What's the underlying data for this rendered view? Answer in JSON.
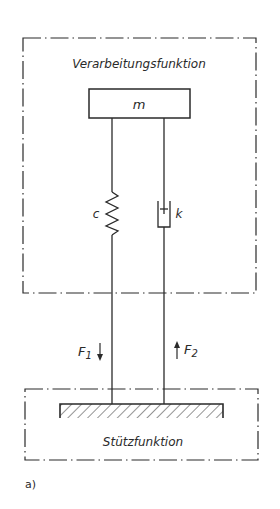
{
  "diagram": {
    "figure_label": "a)",
    "top_region": {
      "label": "Verarbeitungsfunktion"
    },
    "mass": {
      "label": "m"
    },
    "spring": {
      "label": "c"
    },
    "damper": {
      "label": "k"
    },
    "forces": {
      "f1": {
        "label": "F",
        "subscript": "1",
        "direction": "down"
      },
      "f2": {
        "label": "F",
        "subscript": "2",
        "direction": "up"
      }
    },
    "bottom_region": {
      "label": "Stützfunktion"
    },
    "colors": {
      "line": "#2a2a2a",
      "background": "#ffffff"
    }
  }
}
